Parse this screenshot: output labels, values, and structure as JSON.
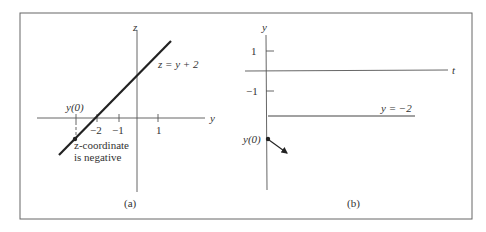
{
  "figure": {
    "panel_a": {
      "caption": "(a)",
      "vertical_axis_label": "z",
      "horizontal_axis_label": "y",
      "line_label": "z = y + 2",
      "point_label": "y(0)",
      "tick_labels": [
        "−2",
        "−1",
        "1"
      ],
      "annotation_line1": "z-coordinate",
      "annotation_line2": "is negative"
    },
    "panel_b": {
      "caption": "(b)",
      "vertical_axis_label": "y",
      "horizontal_axis_label": "t",
      "tick_labels": [
        "1",
        "−1"
      ],
      "equilibrium_label": "y = −2",
      "point_label": "y(0)"
    }
  }
}
